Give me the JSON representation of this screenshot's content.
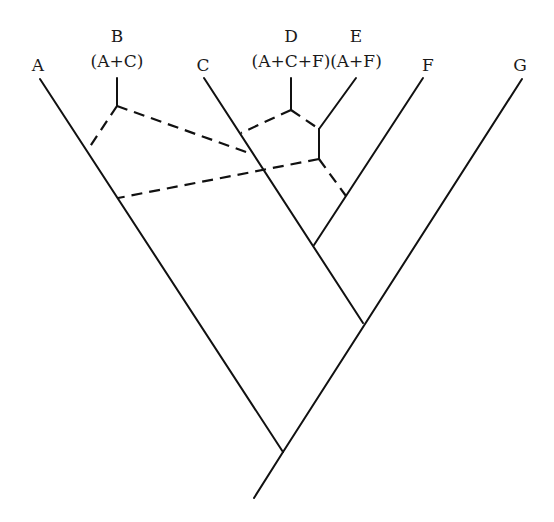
{
  "diagram": {
    "type": "phylogenetic-network",
    "taxa": [
      {
        "id": "A",
        "label": "A",
        "sublabel": "",
        "x": 38,
        "y": 71,
        "tip": [
          40,
          79
        ]
      },
      {
        "id": "B",
        "label": "B",
        "sublabel": "(A+C)",
        "x": 117,
        "y": 42,
        "sub_y": 67,
        "tip": [
          117,
          78
        ]
      },
      {
        "id": "C",
        "label": "C",
        "sublabel": "",
        "x": 203,
        "y": 71,
        "tip": [
          204,
          78
        ]
      },
      {
        "id": "D",
        "label": "D",
        "sublabel": "(A+C+F)",
        "x": 291,
        "y": 42,
        "sub_y": 67,
        "tip": [
          291,
          78
        ]
      },
      {
        "id": "E",
        "label": "E",
        "sublabel": "(A+F)",
        "x": 356,
        "y": 42,
        "sub_y": 67,
        "tip": [
          356,
          78
        ]
      },
      {
        "id": "F",
        "label": "F",
        "sublabel": "",
        "x": 428,
        "y": 71,
        "tip": [
          423,
          78
        ]
      },
      {
        "id": "G",
        "label": "G",
        "sublabel": "",
        "x": 520,
        "y": 71,
        "tip": [
          522,
          79
        ]
      }
    ],
    "solid_edges": [
      {
        "name": "branch-A",
        "from": [
          40,
          79
        ],
        "to": [
          283,
          452
        ]
      },
      {
        "name": "branch-G",
        "from": [
          522,
          79
        ],
        "to": [
          283,
          452
        ]
      },
      {
        "name": "root-stem",
        "from": [
          283,
          452
        ],
        "to": [
          254,
          498
        ]
      },
      {
        "name": "branch-C",
        "from": [
          204,
          78
        ],
        "to": [
          363,
          323
        ]
      },
      {
        "name": "branch-F",
        "from": [
          423,
          78
        ],
        "to": [
          314,
          245
        ]
      },
      {
        "name": "branch-B-stem",
        "from": [
          117,
          78
        ],
        "to": [
          117,
          106
        ]
      },
      {
        "name": "branch-D-stem",
        "from": [
          291,
          78
        ],
        "to": [
          291,
          110
        ]
      },
      {
        "name": "branch-E-tip",
        "from": [
          356,
          78
        ],
        "to": [
          319,
          129
        ]
      },
      {
        "name": "branch-E-vertical",
        "from": [
          319,
          129
        ],
        "to": [
          319,
          159
        ]
      }
    ],
    "dashed_edges": [
      {
        "name": "B-to-A",
        "from": [
          117,
          106
        ],
        "to": [
          87,
          151
        ]
      },
      {
        "name": "B-to-C",
        "from": [
          117,
          106
        ],
        "to": [
          249,
          153
        ]
      },
      {
        "name": "D-to-C",
        "from": [
          291,
          110
        ],
        "to": [
          241,
          133
        ]
      },
      {
        "name": "D-to-E",
        "from": [
          291,
          110
        ],
        "to": [
          319,
          129
        ]
      },
      {
        "name": "E-to-A",
        "from": [
          319,
          159
        ],
        "to": [
          118,
          198
        ]
      },
      {
        "name": "E-to-F",
        "from": [
          319,
          159
        ],
        "to": [
          346,
          196
        ]
      }
    ]
  }
}
